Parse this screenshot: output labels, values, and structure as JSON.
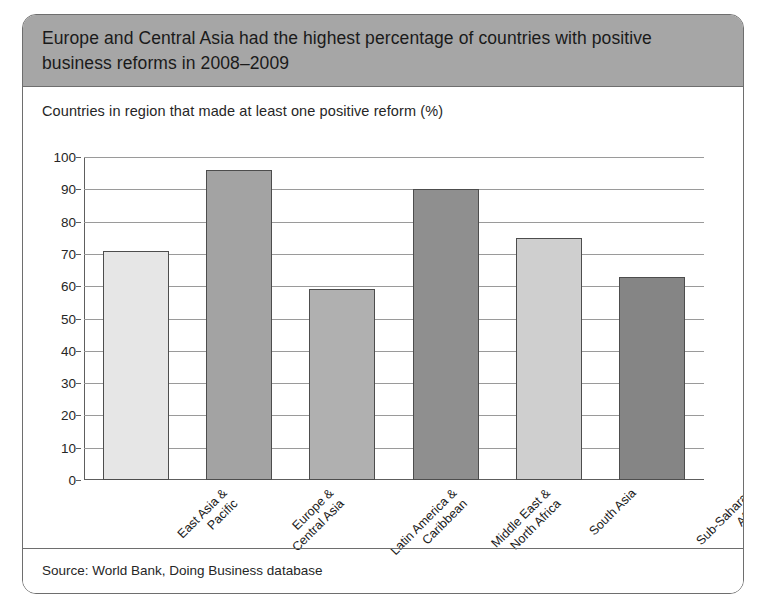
{
  "figure": {
    "title": "Europe and Central Asia had the highest percentage of countries with positive business reforms in 2008–2009",
    "source": "Source: World Bank, Doing Business database"
  },
  "colors": {
    "header_band": "#a6a6a6",
    "card_border": "#6e6e6e",
    "gridline": "#9a9a9a",
    "axis": "#5e5e5e",
    "bar_border": "#4d4d4d"
  },
  "chart_data": {
    "type": "bar",
    "title": "Europe and Central Asia had the highest percentage of countries with positive business reforms in 2008–2009",
    "subtitle": "Countries in region that made at least one positive reform (%)",
    "xlabel": "",
    "ylabel": "",
    "ylim": [
      0,
      100
    ],
    "yticks": [
      0,
      10,
      20,
      30,
      40,
      50,
      60,
      70,
      80,
      90,
      100
    ],
    "grid": true,
    "legend": "none",
    "categories": [
      "East Asia & Pacific",
      "Europe & Central Asia",
      "Latin America & Caribbean",
      "Middle East & North Africa",
      "South Asia",
      "Sub-Saharan Africa"
    ],
    "category_lines": [
      [
        "East Asia &",
        "Pacific"
      ],
      [
        "Europe &",
        "Central Asia"
      ],
      [
        "Latin America &",
        "Caribbean"
      ],
      [
        "Middle East &",
        "North Africa"
      ],
      [
        "South Asia"
      ],
      [
        "Sub-Saharan",
        "Africa"
      ]
    ],
    "values": [
      71,
      96,
      59,
      90,
      75,
      63
    ],
    "bar_colors": [
      "#e6e6e6",
      "#a3a3a3",
      "#b0b0b0",
      "#8f8f8f",
      "#cfcfcf",
      "#858585"
    ],
    "source": "Source: World Bank, Doing Business database"
  }
}
